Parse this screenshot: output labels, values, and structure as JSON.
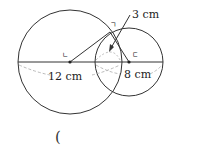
{
  "diagram": {
    "large_circle": {
      "center_label": "ㄴ",
      "diameter_label": "12 cm"
    },
    "small_circle": {
      "center_label": "ㄷ",
      "diameter_label": "8 cm"
    },
    "intersection_point_label": "ㄱ",
    "overlap_label": "3 cm"
  },
  "answer_blank": {
    "open_paren": "("
  },
  "colors": {
    "stroke": "#333333",
    "dashed": "#aaaaaa"
  }
}
